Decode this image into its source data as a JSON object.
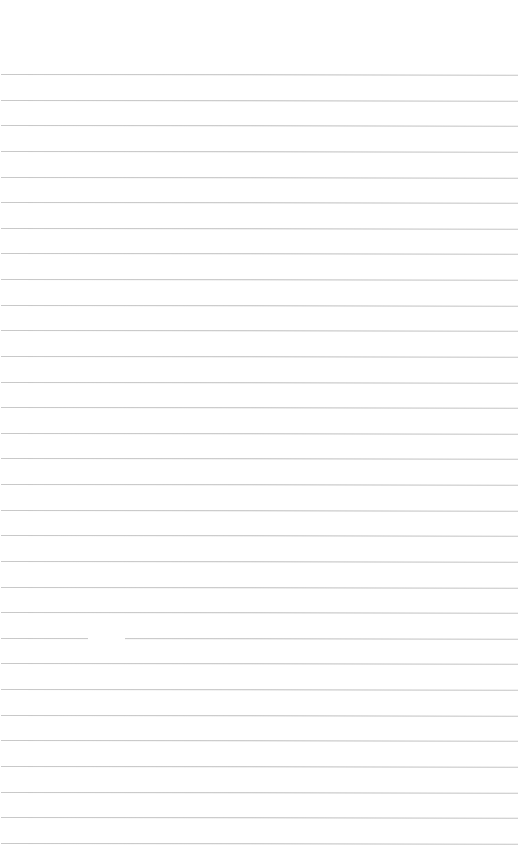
{
  "page": {
    "type": "lined-paper",
    "background_color": "#ffffff",
    "line_color": "#c4c4c4",
    "line_count": 31,
    "first_line_y": 74,
    "line_spacing": 25.63,
    "line_left": 1,
    "line_width": 517,
    "gaps": [
      {
        "line_index": 22,
        "x": 88,
        "width": 37
      }
    ]
  }
}
